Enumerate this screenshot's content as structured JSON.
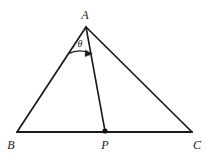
{
  "figure": {
    "kind": "geometry-diagram",
    "canvas": {
      "width": 207,
      "height": 160
    },
    "colors": {
      "background": "#ffffff",
      "stroke": "#1a1a1a",
      "label": "#1a1a1a",
      "point_fill": "#111111"
    },
    "stroke_width": 1.6,
    "points": [
      {
        "id": "A",
        "label": "A",
        "x": 86,
        "y": 27,
        "label_x": 85,
        "label_y": 15,
        "marked": false
      },
      {
        "id": "B",
        "label": "B",
        "x": 17,
        "y": 132,
        "label_x": 11,
        "label_y": 145,
        "marked": false
      },
      {
        "id": "P",
        "label": "P",
        "x": 105,
        "y": 131,
        "label_x": 105,
        "label_y": 145,
        "marked": true
      },
      {
        "id": "C",
        "label": "C",
        "x": 192,
        "y": 132,
        "label_x": 197,
        "label_y": 145,
        "marked": false
      }
    ],
    "segments": [
      {
        "id": "AB",
        "from": "A",
        "to": "B"
      },
      {
        "id": "AC",
        "from": "A",
        "to": "C"
      },
      {
        "id": "BC",
        "from": "B",
        "to": "C"
      },
      {
        "id": "AP",
        "from": "A",
        "to": "P"
      }
    ],
    "angle": {
      "id": "theta-at-A",
      "symbol": "θ",
      "at_vertex": "A",
      "between": [
        "AB",
        "AP"
      ],
      "label_x": 80,
      "label_y": 44,
      "arc_radius": 27,
      "arrow": "clockwise-to-AP"
    },
    "point_marker_radius": 2.6
  }
}
